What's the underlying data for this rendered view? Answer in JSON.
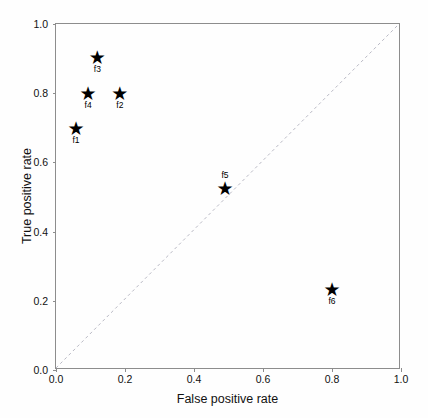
{
  "chart_data": {
    "type": "scatter",
    "title": "",
    "xlabel": "False positive rate",
    "ylabel": "True positive rate",
    "xlim": [
      0.0,
      1.0
    ],
    "ylim": [
      0.0,
      1.0
    ],
    "xticks": [
      "0.0",
      "0.2",
      "0.4",
      "0.6",
      "0.8",
      "1.0"
    ],
    "xtick_values": [
      0.0,
      0.2,
      0.4,
      0.6,
      0.8,
      1.0
    ],
    "yticks": [
      "0.0",
      "0.2",
      "0.4",
      "0.6",
      "0.8",
      "1.0"
    ],
    "ytick_values": [
      0.0,
      0.2,
      0.4,
      0.6,
      0.8,
      1.0
    ],
    "grid": false,
    "legend": false,
    "marker": "star",
    "marker_color": "#000000",
    "points": [
      {
        "label": "f1",
        "x": 0.058,
        "y": 0.7,
        "label_position": "below"
      },
      {
        "label": "f4",
        "x": 0.093,
        "y": 0.8,
        "label_position": "below"
      },
      {
        "label": "f3",
        "x": 0.12,
        "y": 0.905,
        "label_position": "below"
      },
      {
        "label": "f2",
        "x": 0.185,
        "y": 0.8,
        "label_position": "below"
      },
      {
        "label": "f5",
        "x": 0.49,
        "y": 0.525,
        "label_position": "above"
      },
      {
        "label": "f6",
        "x": 0.8,
        "y": 0.235,
        "label_position": "below"
      }
    ],
    "reference_line": {
      "name": "chance-diagonal",
      "from": [
        0.0,
        0.0
      ],
      "to": [
        1.0,
        1.0
      ],
      "style": "dashed",
      "color": "#b9b9c4"
    },
    "star_glyph": "★"
  }
}
